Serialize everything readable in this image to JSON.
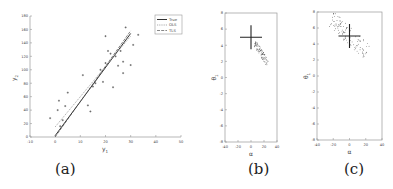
{
  "chart_data": [
    {
      "panel": "a",
      "type": "scatter",
      "caption": "(a)",
      "xlabel": "y1",
      "ylabel": "y2",
      "xlim": [
        -10,
        50
      ],
      "ylim": [
        0,
        180
      ],
      "xticks": [
        -10,
        0,
        10,
        20,
        30,
        40,
        50
      ],
      "yticks": [
        0,
        20,
        40,
        60,
        80,
        100,
        120,
        140,
        160,
        180
      ],
      "legend": {
        "position": "upper right",
        "entries": [
          "True",
          "OLS",
          "TLS"
        ]
      },
      "points": [
        [
          -2,
          28
        ],
        [
          1,
          40
        ],
        [
          1.5,
          54
        ],
        [
          4,
          46
        ],
        [
          5,
          66
        ],
        [
          3,
          25
        ],
        [
          2,
          16
        ],
        [
          11,
          92
        ],
        [
          13,
          47
        ],
        [
          14,
          38
        ],
        [
          15,
          75
        ],
        [
          16,
          80
        ],
        [
          19,
          82
        ],
        [
          20,
          150
        ],
        [
          21,
          128
        ],
        [
          22,
          124
        ],
        [
          23,
          74
        ],
        [
          24,
          120
        ],
        [
          25,
          106
        ],
        [
          26,
          128
        ],
        [
          27,
          112
        ],
        [
          27,
          95
        ],
        [
          28,
          163
        ],
        [
          30,
          107
        ],
        [
          31,
          137
        ],
        [
          33,
          152
        ],
        [
          18,
          100
        ],
        [
          20,
          110
        ]
      ],
      "series": [
        {
          "name": "True",
          "x": [
            0,
            30
          ],
          "y": [
            2,
            154
          ]
        },
        {
          "name": "OLS",
          "x": [
            0,
            30
          ],
          "y": [
            15,
            150
          ]
        },
        {
          "name": "TLS",
          "x": [
            0,
            30
          ],
          "y": [
            0,
            158
          ]
        }
      ]
    },
    {
      "panel": "b",
      "type": "scatter",
      "caption": "(b)",
      "xlabel": "α",
      "ylabel": "θ1",
      "xlim": [
        -40,
        40
      ],
      "ylim": [
        -8,
        8
      ],
      "xticks": [
        -40,
        -20,
        0,
        20,
        40
      ],
      "yticks": [
        -8,
        -6,
        -4,
        -2,
        0,
        2,
        4,
        6,
        8
      ],
      "marker_cross": {
        "x": 0,
        "y": 5
      },
      "cloud": {
        "center": [
          20,
          2.8
        ],
        "spread": "narrow elongated, negative slope"
      }
    },
    {
      "panel": "c",
      "type": "scatter",
      "caption": "(c)",
      "xlabel": "α",
      "ylabel": "θ1",
      "xlim": [
        -40,
        40
      ],
      "ylim": [
        -8,
        8
      ],
      "xticks": [
        -40,
        -20,
        0,
        20,
        40
      ],
      "yticks": [
        -8,
        -6,
        -4,
        -2,
        0,
        2,
        4,
        6,
        8
      ],
      "marker_cross": {
        "x": 0,
        "y": 5
      },
      "cloud": {
        "center": [
          0,
          5
        ],
        "spread": "wide elongated, negative slope"
      }
    }
  ]
}
